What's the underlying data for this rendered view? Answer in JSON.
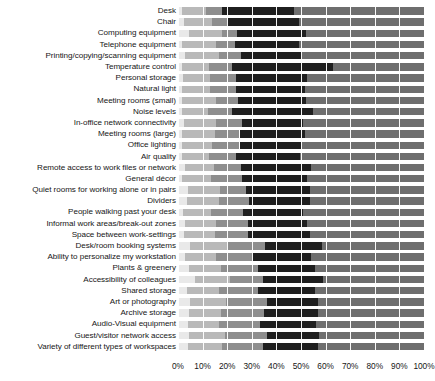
{
  "chart_data": {
    "type": "bar",
    "subtype": "stacked-horizontal-100-percent",
    "title": "",
    "xlabel": "",
    "ylabel": "",
    "xlim": [
      0,
      100
    ],
    "xticks": [
      "0%",
      "10%",
      "20%",
      "30%",
      "40%",
      "50%",
      "60%",
      "70%",
      "80%",
      "90%",
      "100%"
    ],
    "xtick_values": [
      0,
      10,
      20,
      30,
      40,
      50,
      60,
      70,
      80,
      90,
      100
    ],
    "grid": true,
    "legend": "none",
    "orientation": "horizontal",
    "series": [
      {
        "name": "segment-1",
        "color": "#e9e9e9"
      },
      {
        "name": "segment-2",
        "color": "#b9b9b9"
      },
      {
        "name": "segment-3",
        "color": "#8e8e8e"
      },
      {
        "name": "segment-4",
        "color": "#1f1f1f"
      },
      {
        "name": "segment-5",
        "color": "#6e6e6e"
      }
    ],
    "categories": [
      "Desk",
      "Chair",
      "Computing equipment",
      "Telephone equipment",
      "Printing/copying/scanning equipment",
      "Temperature control",
      "Personal storage",
      "Natural light",
      "Meeting rooms (small)",
      "Noise levels",
      "In-office network connectivity",
      "Meeting rooms (large)",
      "Office lighting",
      "Air quality",
      "Remote access to work files or network",
      "General décor",
      "Quiet rooms for working alone or in pairs",
      "Dividers",
      "People walking past your desk",
      "Informal work areas/break-out zones",
      "Space between work-settings",
      "Desk/room booking systems",
      "Ability to personalize my workstation",
      "Plants & greenery",
      "Accessibility of colleagues",
      "Shared storage",
      "Art or photography",
      "Archive storage",
      "Audio-Visual equipment",
      "Guest/visitor network access",
      "Variety of different types of workspaces"
    ],
    "values": [
      [
        1.5,
        10.0,
        6.5,
        29.0,
        41.0,
        12.0
      ],
      [
        2.5,
        11.5,
        6.0,
        29.0,
        38.0,
        13.0
      ],
      [
        4.5,
        13.5,
        6.0,
        28.0,
        36.0,
        12.0
      ],
      [
        1.5,
        14.0,
        7.5,
        26.0,
        38.0,
        13.0
      ],
      [
        3.0,
        13.5,
        9.0,
        25.0,
        36.5,
        13.0
      ],
      [
        1.5,
        11.0,
        9.5,
        41.0,
        22.0,
        15.0
      ],
      [
        2.0,
        11.0,
        10.5,
        29.0,
        36.0,
        11.5
      ],
      [
        1.5,
        11.5,
        10.5,
        28.0,
        36.0,
        12.5
      ],
      [
        1.5,
        14.0,
        9.0,
        27.5,
        31.0,
        17.0
      ],
      [
        1.5,
        10.5,
        10.0,
        33.0,
        30.0,
        15.0
      ],
      [
        2.5,
        13.0,
        10.5,
        25.0,
        37.0,
        12.0
      ],
      [
        1.5,
        13.5,
        10.0,
        26.5,
        31.0,
        17.5
      ],
      [
        1.5,
        12.5,
        11.0,
        25.0,
        37.0,
        13.0
      ],
      [
        1.5,
        11.0,
        11.0,
        26.0,
        34.5,
        16.0
      ],
      [
        3.0,
        11.5,
        11.0,
        28.5,
        32.5,
        13.5
      ],
      [
        1.5,
        12.0,
        12.5,
        26.5,
        32.0,
        15.5
      ],
      [
        4.0,
        13.0,
        10.5,
        26.0,
        31.0,
        15.5
      ],
      [
        3.5,
        13.0,
        12.5,
        24.5,
        29.5,
        17.0
      ],
      [
        2.0,
        11.5,
        13.0,
        24.5,
        30.0,
        19.0
      ],
      [
        3.0,
        12.5,
        13.0,
        24.0,
        30.5,
        17.0
      ],
      [
        2.5,
        12.5,
        13.5,
        25.0,
        30.0,
        16.5
      ],
      [
        5.0,
        15.0,
        15.5,
        23.0,
        25.5,
        16.0
      ],
      [
        3.0,
        12.5,
        14.5,
        24.0,
        28.5,
        17.5
      ],
      [
        4.5,
        13.0,
        15.0,
        23.0,
        27.5,
        17.0
      ],
      [
        7.0,
        14.0,
        13.5,
        24.5,
        25.0,
        16.0
      ],
      [
        3.5,
        13.0,
        16.0,
        23.0,
        27.0,
        17.5
      ],
      [
        5.0,
        14.5,
        16.5,
        21.0,
        26.5,
        16.5
      ],
      [
        4.5,
        13.0,
        17.5,
        22.0,
        25.5,
        17.5
      ],
      [
        4.0,
        12.5,
        17.0,
        22.5,
        26.0,
        18.0
      ],
      [
        4.5,
        14.5,
        17.0,
        21.5,
        25.5,
        17.0
      ],
      [
        4.0,
        14.0,
        16.5,
        22.5,
        26.0,
        17.0
      ]
    ]
  }
}
